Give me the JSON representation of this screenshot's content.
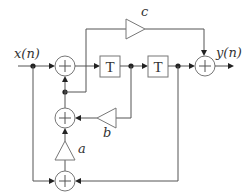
{
  "diagram": {
    "type": "signal-flow block diagram",
    "input_label": "x(n)",
    "output_label": "y(n)",
    "delay_blocks": [
      {
        "id": "delay-1",
        "label": "T"
      },
      {
        "id": "delay-2",
        "label": "T"
      }
    ],
    "gains": [
      {
        "id": "gain-a",
        "label": "a"
      },
      {
        "id": "gain-b",
        "label": "b"
      },
      {
        "id": "gain-c",
        "label": "c"
      }
    ],
    "adders": [
      {
        "id": "adder-top",
        "symbol": "+"
      },
      {
        "id": "adder-middle",
        "symbol": "+"
      },
      {
        "id": "adder-bottom",
        "symbol": "+"
      },
      {
        "id": "adder-output",
        "symbol": "+"
      }
    ],
    "colors": {
      "line": "#555555",
      "block_border": "#777777",
      "node": "#222222",
      "background": "#ffffff"
    }
  }
}
